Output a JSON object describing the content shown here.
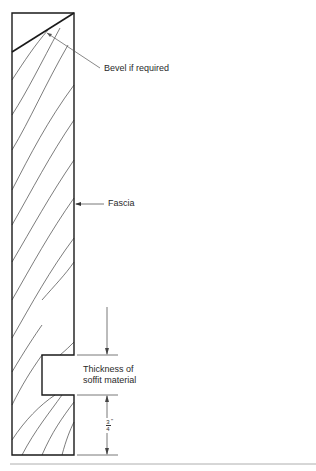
{
  "diagram": {
    "labels": {
      "bevel": "Bevel if required",
      "fascia": "Fascia",
      "soffit_line1": "Thickness of",
      "soffit_line2": "soffit material",
      "dimension_num": "3",
      "dimension_den": "4",
      "dimension_unit": "\""
    },
    "colors": {
      "outline": "#1a1a1a",
      "grain": "#444444",
      "leader": "#555555",
      "rule": "#999999"
    }
  }
}
